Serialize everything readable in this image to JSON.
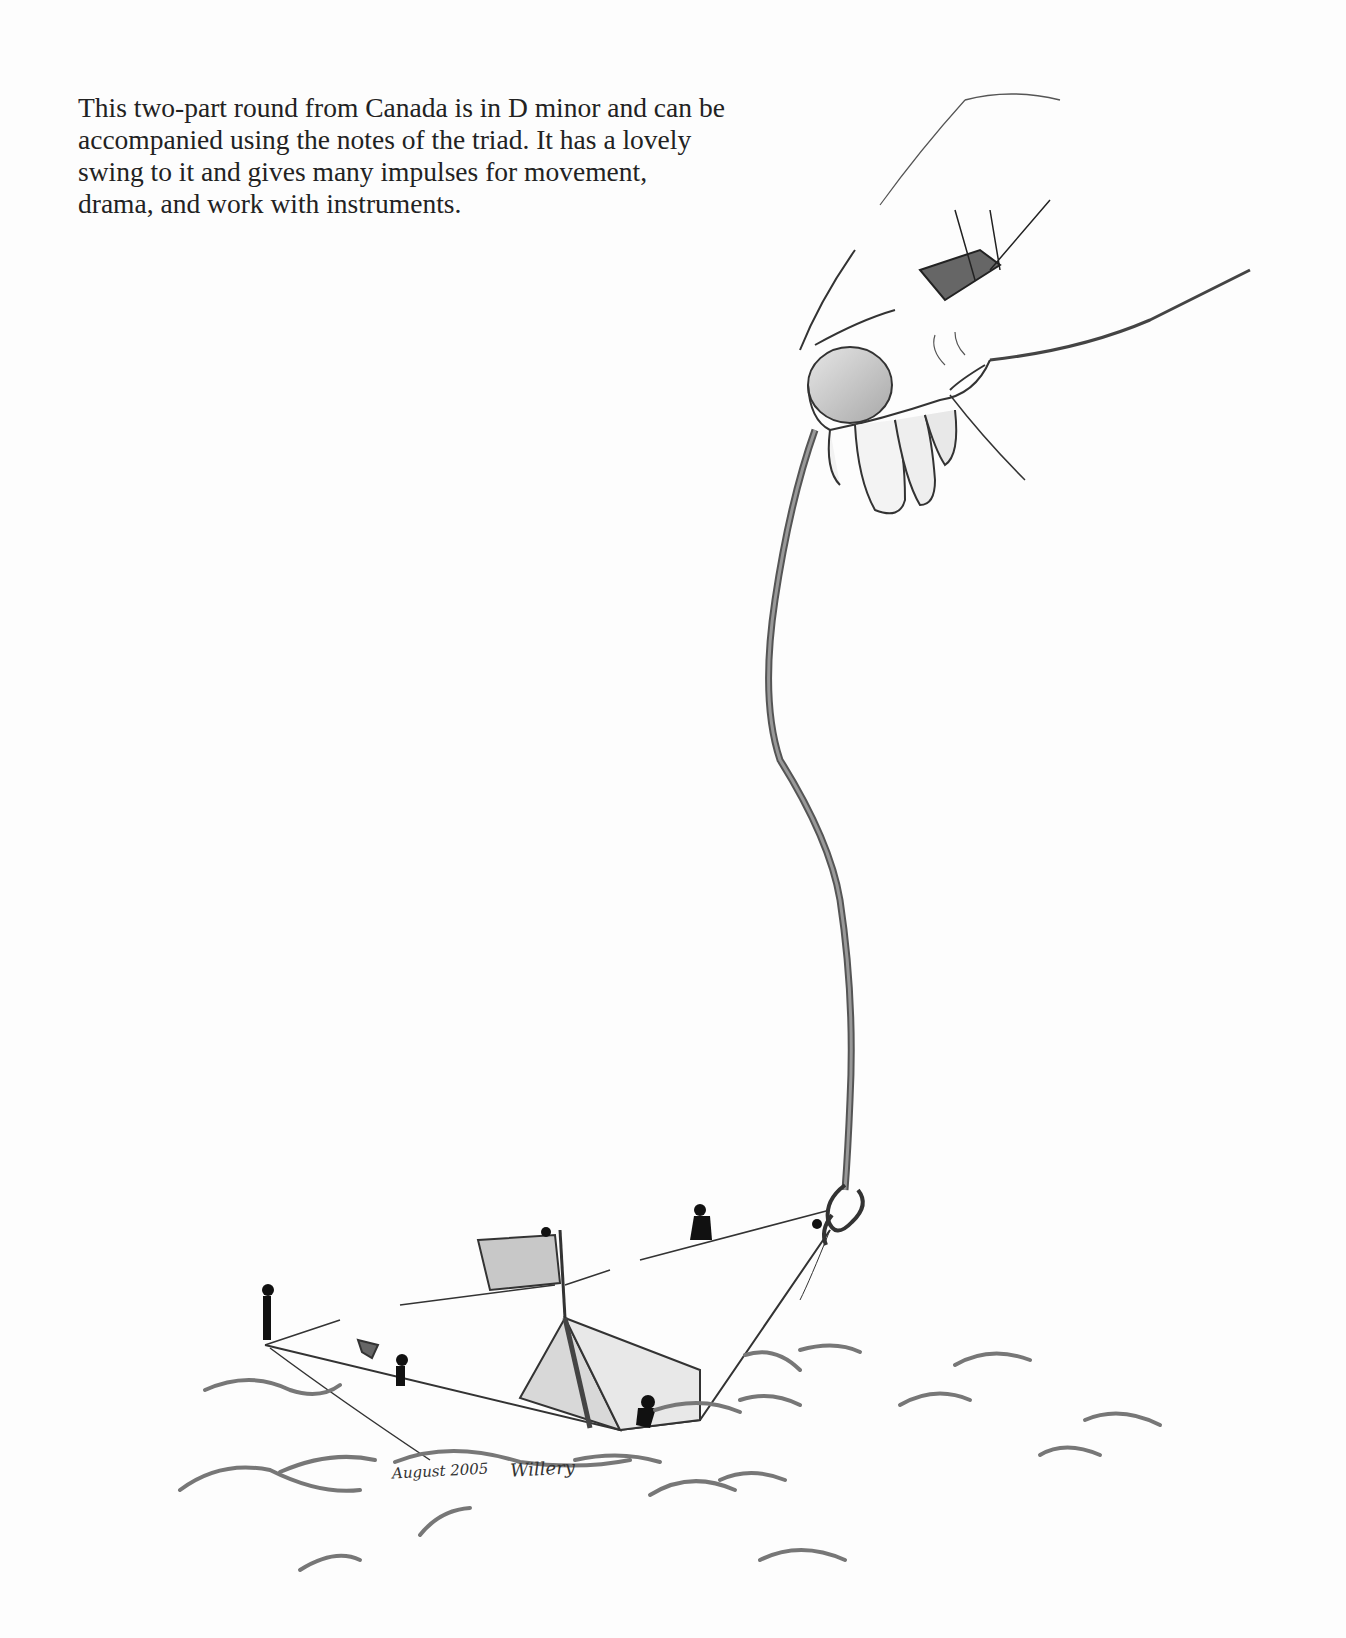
{
  "paragraph": {
    "lines": [
      "This two-part round from Canada is in D minor and can be",
      "accompanied using the notes of the triad. It has a lovely",
      "swing to it and gives many impulses for movement,",
      "drama, and work with instruments."
    ]
  },
  "illustration": {
    "description": "Pencil drawing of a hand holding a long rope attached to a hook that lifts a paper boat with small figures out of waves",
    "signature_date": "August 2005",
    "signature_name": "Willery"
  }
}
